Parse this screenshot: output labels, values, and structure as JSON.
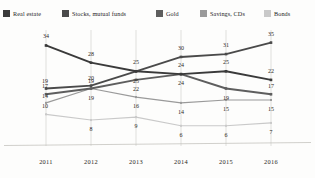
{
  "legend": {
    "position": "top",
    "items": [
      {
        "label": "Real estate",
        "color": "#3a3a3a",
        "icon": "square-swatch-icon"
      },
      {
        "label": "Stocks, mutual funds",
        "color": "#4a4a4a",
        "icon": "square-swatch-icon"
      },
      {
        "label": "Gold",
        "color": "#5e5e5e",
        "icon": "square-swatch-icon"
      },
      {
        "label": "Savings, CDs",
        "color": "#9a9a9a",
        "icon": "square-swatch-icon"
      },
      {
        "label": "Bonds",
        "color": "#c9c9c9",
        "icon": "square-swatch-icon"
      }
    ]
  },
  "chart_data": {
    "type": "line",
    "title": "",
    "subtitle": "",
    "xlabel": "",
    "ylabel": "",
    "categories": [
      "2011",
      "2012",
      "2013",
      "2014",
      "2015",
      "2016"
    ],
    "ylim": [
      0,
      38
    ],
    "grid": "vertical-only",
    "legend_position": "top",
    "data_labels": true,
    "markers": "square",
    "series": [
      {
        "name": "Real estate",
        "color": "#3a3a3a",
        "values": [
          34,
          28,
          25,
          24,
          25,
          22
        ]
      },
      {
        "name": "Stocks, mutual funds",
        "color": "#4a4a4a",
        "values": [
          19,
          20,
          25,
          30,
          31,
          35
        ]
      },
      {
        "name": "Gold",
        "color": "#5e5e5e",
        "values": [
          17,
          19,
          22,
          24,
          19,
          17
        ]
      },
      {
        "name": "Savings, CDs",
        "color": "#9a9a9a",
        "values": [
          14,
          19,
          16,
          14,
          15,
          15
        ]
      },
      {
        "name": "Bonds",
        "color": "#c9c9c9",
        "values": [
          10,
          8,
          9,
          6,
          6,
          7
        ]
      }
    ]
  },
  "axis": {
    "ticks": [
      "2011",
      "2012",
      "2013",
      "2014",
      "2015",
      "2016"
    ]
  }
}
